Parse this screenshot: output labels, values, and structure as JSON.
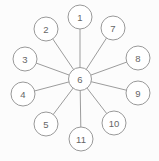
{
  "diagram": {
    "type": "hub-and-spoke",
    "background": "#fcfcfc",
    "node_fill": "#ffffff",
    "node_stroke": "#999999",
    "edge_color": "#9c9c9c",
    "label_color": "#666666",
    "hub_label": "6",
    "node_radius": 12,
    "hub_radius": 11.5,
    "nodes": [
      {
        "label": "1",
        "x": 80,
        "y": 17
      },
      {
        "label": "2",
        "x": 46,
        "y": 29
      },
      {
        "label": "3",
        "x": 25,
        "y": 59
      },
      {
        "label": "4",
        "x": 23,
        "y": 94
      },
      {
        "label": "5",
        "x": 46,
        "y": 124
      },
      {
        "label": "6",
        "x": 80,
        "y": 79
      },
      {
        "label": "7",
        "x": 113,
        "y": 28
      },
      {
        "label": "8",
        "x": 138,
        "y": 58
      },
      {
        "label": "9",
        "x": 138,
        "y": 93
      },
      {
        "label": "10",
        "x": 114,
        "y": 123
      },
      {
        "label": "11",
        "x": 81,
        "y": 139
      }
    ],
    "edges": [
      [
        "6",
        "1"
      ],
      [
        "6",
        "2"
      ],
      [
        "6",
        "3"
      ],
      [
        "6",
        "4"
      ],
      [
        "6",
        "5"
      ],
      [
        "6",
        "7"
      ],
      [
        "6",
        "8"
      ],
      [
        "6",
        "9"
      ],
      [
        "6",
        "10"
      ],
      [
        "6",
        "11"
      ]
    ]
  }
}
